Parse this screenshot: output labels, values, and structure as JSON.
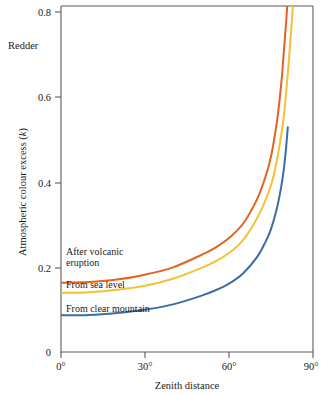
{
  "figure": {
    "annotation_topleft": "Redder",
    "background_color": "#ffffff",
    "axis_color": "#5b5b5b"
  },
  "chart_data": {
    "type": "line",
    "title": "",
    "xlabel": "Zenith distance",
    "ylabel": "Atmospheric colour excess (k)",
    "ylabel_main": "Atmospheric colour excess (",
    "ylabel_italic": "k",
    "ylabel_close": ")",
    "xlim": [
      0,
      90
    ],
    "ylim": [
      0,
      0.85
    ],
    "xticks": [
      0,
      30,
      60,
      90
    ],
    "xtick_labels": [
      "0°",
      "30°",
      "60°",
      "90°"
    ],
    "yticks": [
      0,
      0.2,
      0.4,
      0.6,
      0.8
    ],
    "ytick_labels": [
      "0",
      "0.2",
      "0.4",
      "0.6",
      "0.8"
    ],
    "grid": false,
    "legend_position": "inline-labels",
    "annotations": [
      "Redder"
    ],
    "series": [
      {
        "name": "After volcanic eruption",
        "label_lines": [
          "After volcanic",
          "eruption"
        ],
        "color": "#E2631F",
        "x": [
          0,
          10,
          20,
          30,
          40,
          50,
          55,
          60,
          65,
          70,
          73,
          75,
          77,
          78,
          79,
          80,
          80.5,
          81
        ],
        "values": [
          0.17,
          0.172,
          0.178,
          0.19,
          0.208,
          0.238,
          0.256,
          0.28,
          0.315,
          0.375,
          0.43,
          0.48,
          0.56,
          0.615,
          0.685,
          0.775,
          0.82,
          0.87
        ]
      },
      {
        "name": "From sea level",
        "label_lines": [
          "From sea level"
        ],
        "color": "#F5C033",
        "x": [
          0,
          10,
          20,
          30,
          40,
          50,
          55,
          60,
          65,
          70,
          74,
          76,
          78,
          79.5,
          80.5,
          81.5,
          82.3,
          83
        ],
        "values": [
          0.145,
          0.147,
          0.153,
          0.163,
          0.18,
          0.206,
          0.222,
          0.243,
          0.275,
          0.328,
          0.39,
          0.435,
          0.505,
          0.575,
          0.645,
          0.725,
          0.8,
          0.87
        ]
      },
      {
        "name": "From clear mountain",
        "label_lines": [
          "From clear mountain"
        ],
        "color": "#3C6CA8",
        "x": [
          0,
          10,
          20,
          30,
          40,
          50,
          55,
          60,
          65,
          70,
          73,
          75,
          77,
          78.5,
          79.5,
          80.3,
          81
        ],
        "values": [
          0.09,
          0.091,
          0.096,
          0.104,
          0.117,
          0.138,
          0.151,
          0.168,
          0.193,
          0.233,
          0.27,
          0.302,
          0.35,
          0.4,
          0.445,
          0.495,
          0.552
        ]
      }
    ]
  }
}
